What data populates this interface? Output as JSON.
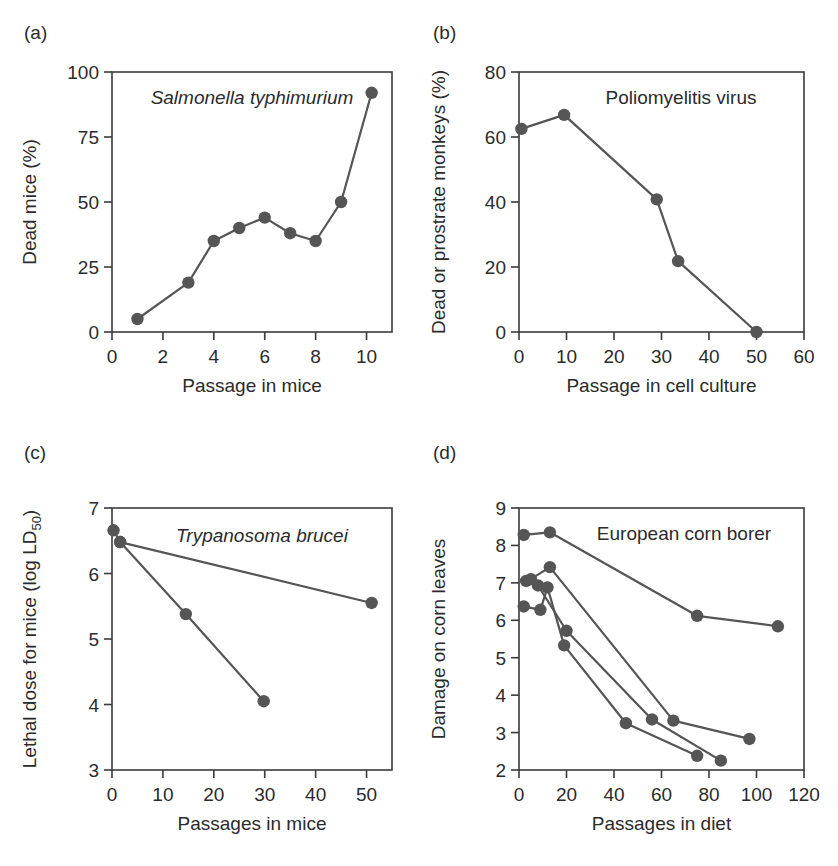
{
  "figure": {
    "panels": [
      {
        "tag": "(a)",
        "series_title": "Salmonella typhimurium",
        "title_italic": true,
        "xlabel": "Passage in mice",
        "ylabel": "Dead mice (%)",
        "ylabel_sub": "",
        "xticks": [
          0,
          2,
          4,
          6,
          8,
          10
        ],
        "yticks": [
          0,
          25,
          50,
          75,
          100
        ],
        "xlim": [
          0,
          11
        ],
        "ylim": [
          0,
          100
        ]
      },
      {
        "tag": "(b)",
        "series_title": "Poliomyelitis virus",
        "title_italic": false,
        "xlabel": "Passage in cell culture",
        "ylabel": "Dead or prostrate monkeys (%)",
        "ylabel_sub": "",
        "xticks": [
          0,
          10,
          20,
          30,
          40,
          50,
          60
        ],
        "yticks": [
          0,
          20,
          40,
          60,
          80
        ],
        "xlim": [
          0,
          60
        ],
        "ylim": [
          0,
          80
        ]
      },
      {
        "tag": "(c)",
        "series_title": "Trypanosoma brucei",
        "title_italic": true,
        "xlabel": "Passages in mice",
        "ylabel": "Lethal dose for mice (log LD",
        "ylabel_sub": "50",
        "ylabel_tail": ")",
        "xticks": [
          0,
          10,
          20,
          30,
          40,
          50
        ],
        "yticks": [
          3,
          4,
          5,
          6,
          7
        ],
        "xlim": [
          0,
          55
        ],
        "ylim": [
          3,
          7
        ]
      },
      {
        "tag": "(d)",
        "series_title": "European corn borer",
        "title_italic": false,
        "xlabel": "Passages in diet",
        "ylabel": "Damage on corn leaves",
        "ylabel_sub": "",
        "xticks": [
          0,
          20,
          40,
          60,
          80,
          100,
          120
        ],
        "yticks": [
          2,
          3,
          4,
          5,
          6,
          7,
          8,
          9
        ],
        "xlim": [
          0,
          120
        ],
        "ylim": [
          2,
          9
        ]
      }
    ]
  },
  "chart_data": [
    {
      "type": "line",
      "panel": "(a)",
      "title": "Salmonella typhimurium",
      "xlabel": "Passage in mice",
      "ylabel": "Dead mice (%)",
      "xlim": [
        0,
        11
      ],
      "ylim": [
        0,
        100
      ],
      "xticks": [
        0,
        2,
        4,
        6,
        8,
        10
      ],
      "yticks": [
        0,
        25,
        50,
        75,
        100
      ],
      "grid": false,
      "legend": "none",
      "series": [
        {
          "name": "Dead mice",
          "x": [
            1,
            3,
            4,
            5,
            6,
            7,
            8,
            9,
            10.2
          ],
          "values": [
            5,
            19,
            35,
            40,
            44,
            38,
            35,
            50,
            92
          ]
        }
      ]
    },
    {
      "type": "line",
      "panel": "(b)",
      "title": "Poliomyelitis virus",
      "xlabel": "Passage in cell culture",
      "ylabel": "Dead or prostrate monkeys (%)",
      "xlim": [
        0,
        60
      ],
      "ylim": [
        0,
        80
      ],
      "xticks": [
        0,
        10,
        20,
        30,
        40,
        50,
        60
      ],
      "yticks": [
        0,
        20,
        40,
        60,
        80
      ],
      "grid": false,
      "legend": "none",
      "series": [
        {
          "name": "Dead or prostrate monkeys",
          "x": [
            0.5,
            9.5,
            29,
            33.5,
            50
          ],
          "values": [
            62.5,
            66.8,
            40.8,
            21.8,
            0
          ]
        }
      ]
    },
    {
      "type": "line",
      "panel": "(c)",
      "title": "Trypanosoma brucei",
      "xlabel": "Passages in mice",
      "ylabel": "Lethal dose for mice (log LD50)",
      "xlim": [
        0,
        55
      ],
      "ylim": [
        3,
        7
      ],
      "xticks": [
        0,
        10,
        20,
        30,
        40,
        50
      ],
      "yticks": [
        3,
        4,
        5,
        6,
        7
      ],
      "grid": false,
      "legend": "none",
      "series": [
        {
          "name": "Slow attenuation line",
          "x": [
            0.3,
            1.6,
            51
          ],
          "values": [
            6.66,
            6.48,
            5.55
          ]
        },
        {
          "name": "Rapid attenuation line",
          "x": [
            1.6,
            14.5,
            29.8
          ],
          "values": [
            6.48,
            5.38,
            4.05
          ]
        }
      ]
    },
    {
      "type": "line",
      "panel": "(d)",
      "title": "European corn borer",
      "xlabel": "Passages in diet",
      "ylabel": "Damage on corn leaves",
      "xlim": [
        0,
        120
      ],
      "ylim": [
        2,
        9
      ],
      "xticks": [
        0,
        20,
        40,
        60,
        80,
        100,
        120
      ],
      "yticks": [
        2,
        3,
        4,
        5,
        6,
        7,
        8,
        9
      ],
      "grid": false,
      "legend": "none",
      "series": [
        {
          "name": "Strain 1",
          "x": [
            2,
            13,
            75,
            109
          ],
          "values": [
            8.28,
            8.35,
            6.12,
            5.84
          ]
        },
        {
          "name": "Strain 2",
          "x": [
            5,
            13,
            65,
            97
          ],
          "values": [
            7.1,
            7.42,
            3.32,
            2.83
          ]
        },
        {
          "name": "Strain 3",
          "x": [
            3,
            8,
            20,
            56,
            85
          ],
          "values": [
            7.05,
            6.93,
            5.72,
            3.35,
            2.25
          ]
        },
        {
          "name": "Strain 4",
          "x": [
            2,
            9,
            12,
            19,
            45,
            75
          ],
          "values": [
            6.37,
            6.28,
            6.88,
            5.33,
            3.25,
            2.38
          ]
        }
      ]
    }
  ]
}
